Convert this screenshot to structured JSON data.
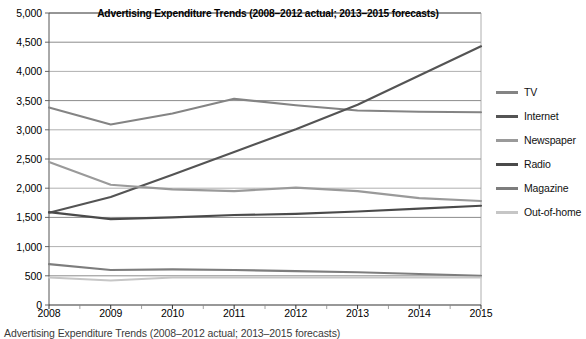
{
  "chart_data": {
    "type": "line",
    "title": "Advertising Expenditure Trends (2008–2012 actual; 2013–2015 forecasts)",
    "xlabel": "",
    "ylabel": "",
    "x": [
      2008,
      2009,
      2010,
      2011,
      2012,
      2013,
      2014,
      2015
    ],
    "categories": [
      "2008",
      "2009",
      "2010",
      "2011",
      "2012",
      "2013",
      "2014",
      "2015"
    ],
    "ylim": [
      0,
      5000
    ],
    "ytick_values": [
      0,
      500,
      1000,
      1500,
      2000,
      2500,
      3000,
      3500,
      4000,
      4500,
      5000
    ],
    "ytick_labels": [
      "0",
      "500",
      "1,000",
      "1,500",
      "2,000",
      "2,500",
      "3,000",
      "3,500",
      "4,000",
      "4,500",
      "5,000"
    ],
    "grid": true,
    "grid_axis": "y",
    "legend_position": "right",
    "series": [
      {
        "name": "TV",
        "color": "#848484",
        "values": [
          3380,
          3090,
          3280,
          3530,
          3420,
          3330,
          3310,
          3300
        ]
      },
      {
        "name": "Internet",
        "color": "#545454",
        "values": [
          1580,
          1850,
          2230,
          2620,
          3010,
          3430,
          3930,
          4430
        ]
      },
      {
        "name": "Newspaper",
        "color": "#9a9a9a",
        "values": [
          2450,
          2060,
          1980,
          1950,
          2010,
          1950,
          1830,
          1780
        ]
      },
      {
        "name": "Radio",
        "color": "#4a4a4a",
        "values": [
          1590,
          1470,
          1500,
          1540,
          1560,
          1600,
          1650,
          1700
        ]
      },
      {
        "name": "Magazine",
        "color": "#7d7d7d",
        "values": [
          700,
          600,
          610,
          600,
          580,
          560,
          530,
          500
        ]
      },
      {
        "name": "Out-of-home",
        "color": "#c6c6c6",
        "values": [
          470,
          420,
          470,
          470,
          470,
          470,
          470,
          470
        ]
      }
    ]
  },
  "caption": {
    "text": "Advertising Expenditure Trends (2008–2012 actual; 2013–2015 forecasts)"
  }
}
